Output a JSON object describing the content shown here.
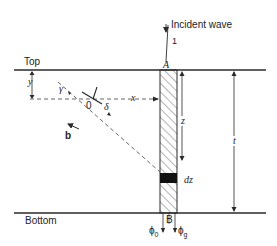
{
  "figure": {
    "type": "cross-section diagram",
    "colors": {
      "line": "#2a2a2a",
      "dashed": "#555555",
      "band": "#111111",
      "background": "#ffffff"
    }
  },
  "labels": {
    "incident_wave": "Incident wave",
    "ray_number": "1",
    "point_a": "A",
    "point_b": "B",
    "top": "Top",
    "bottom": "Bottom",
    "y": "y",
    "gamma": "γ",
    "origin": "0",
    "delta": "δ",
    "x": "x",
    "b": "b",
    "z": "z",
    "dz": "dz",
    "t": "t",
    "phi_0": "ϕ",
    "phi_0_sub": "0",
    "phi_g": "ϕ",
    "phi_g_sub": "g"
  }
}
